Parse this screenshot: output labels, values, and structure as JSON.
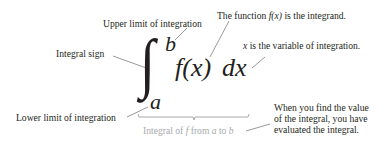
{
  "diagram": {
    "type": "annotated-integral",
    "expression": {
      "integral_sign": "∫",
      "upper_limit": "b",
      "lower_limit": "a",
      "integrand": "f(x)",
      "differential": "dx"
    },
    "labels": {
      "upper_limit": "Upper limit of integration",
      "integral_sign": "Integral sign",
      "integrand_prefix": "The function ",
      "integrand_math": "f(x)",
      "integrand_suffix": " is the integrand.",
      "variable_math": "x",
      "variable_suffix": " is the variable of integration.",
      "lower_limit": "Lower limit of integration",
      "brace_prefix": "Integral of ",
      "brace_f": "f",
      "brace_mid": " from ",
      "brace_a": "a",
      "brace_to": " to ",
      "brace_b": "b",
      "evaluate_line1": "When you find the value",
      "evaluate_line2": "of the integral, you have",
      "evaluate_line3": "evaluated the integral."
    },
    "colors": {
      "text": "#231f20",
      "muted": "#a7a9ac",
      "leader": "#6d6e71"
    }
  }
}
